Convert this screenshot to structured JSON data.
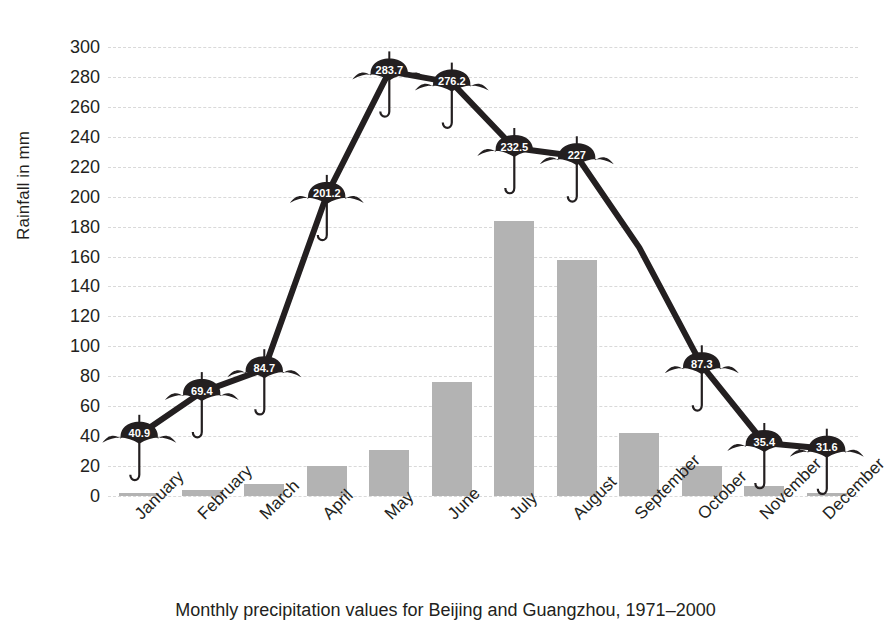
{
  "caption": "Monthly precipitation values for Beijing and Guangzhou, 1971–2000",
  "chart_data": {
    "type": "bar",
    "title": "Monthly precipitation values for Beijing and Guangzhou, 1971–2000",
    "xlabel": "",
    "ylabel": "Rainfall in mm",
    "ylim": [
      0,
      300
    ],
    "ytick_step": 20,
    "grid": true,
    "legend": "none",
    "categories": [
      "January",
      "February",
      "March",
      "April",
      "May",
      "June",
      "July",
      "August",
      "September",
      "October",
      "November",
      "December"
    ],
    "yticks": [
      "300",
      "280",
      "260",
      "240",
      "220",
      "200",
      "180",
      "160",
      "140",
      "120",
      "100",
      "80",
      "60",
      "40",
      "20",
      "0"
    ],
    "series": [
      {
        "name": "Beijing",
        "render": "bar",
        "color": "#b3b3b3",
        "values": [
          2,
          4,
          8,
          20,
          31,
          76,
          184,
          158,
          42,
          20,
          7,
          2
        ]
      },
      {
        "name": "Guangzhou",
        "render": "line-umbrella",
        "color": "#231f20",
        "values": [
          40.9,
          69.4,
          84.7,
          201.2,
          283.7,
          276.2,
          232.5,
          227,
          166,
          87.3,
          35.4,
          31.6
        ],
        "labels": [
          "40.9",
          "69.4",
          "84.7",
          "201.2",
          "283.7",
          "276.2",
          "232.5",
          "227",
          "",
          "87.3",
          "35.4",
          "31.6"
        ],
        "marker_hidden_at": [
          "September"
        ]
      }
    ]
  }
}
